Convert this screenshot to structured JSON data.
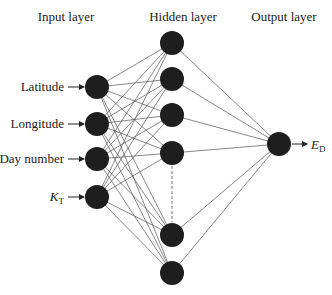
{
  "diagram": {
    "title_layers": {
      "input": "Input layer",
      "hidden": "Hidden layer",
      "output": "Output layer"
    },
    "inputs": [
      {
        "label": "Latitude"
      },
      {
        "label": "Longitude"
      },
      {
        "label": "Day number"
      },
      {
        "label": "K",
        "subscript": "T"
      }
    ],
    "hidden_nodes_visible": 6,
    "hidden_ellipsis": "dashed line indicates more hidden nodes",
    "output": {
      "label": "E",
      "subscript": "D"
    },
    "colors": {
      "node": "#1e1e1e",
      "edge": "#555555",
      "text": "#222222"
    }
  }
}
